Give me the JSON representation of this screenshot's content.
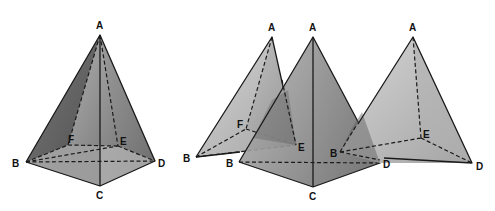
{
  "figure": {
    "colors": {
      "dark_face": "#5e5e5e",
      "mid_face": "#9a9a9a",
      "light_face": "#c6c6c6",
      "base_face": "#b8b8b8",
      "edge": "#1a1a1a",
      "background": "#ffffff"
    },
    "pyramids": [
      {
        "name": "full-pyramid",
        "vertices": {
          "A": [
            100,
            35
          ],
          "B": [
            26,
            162
          ],
          "C": [
            100,
            186
          ],
          "D": [
            155,
            161
          ],
          "E": [
            118,
            146
          ],
          "F": [
            68,
            145
          ]
        },
        "labels": [
          {
            "text": "A",
            "x": 96,
            "y": 29
          },
          {
            "text": "B",
            "x": 12,
            "y": 167
          },
          {
            "text": "C",
            "x": 96,
            "y": 199
          },
          {
            "text": "D",
            "x": 158,
            "y": 167
          },
          {
            "text": "E",
            "x": 120,
            "y": 145
          },
          {
            "text": "F",
            "x": 68,
            "y": 143
          }
        ]
      },
      {
        "name": "tetrahedron-ABFE",
        "vertices": {
          "A": [
            272,
            37
          ],
          "B": [
            196,
            157
          ],
          "F": [
            246,
            129
          ],
          "E": [
            296,
            145
          ]
        },
        "labels": [
          {
            "text": "A",
            "x": 268,
            "y": 31
          },
          {
            "text": "B",
            "x": 183,
            "y": 162
          },
          {
            "text": "F",
            "x": 237,
            "y": 128
          },
          {
            "text": "E",
            "x": 298,
            "y": 151
          }
        ]
      },
      {
        "name": "tetrahedron-ABCD",
        "vertices": {
          "A": [
            313,
            37
          ],
          "B": [
            239,
            162
          ],
          "C": [
            313,
            187
          ],
          "D": [
            380,
            163
          ]
        },
        "labels": [
          {
            "text": "A",
            "x": 309,
            "y": 31
          },
          {
            "text": "B",
            "x": 226,
            "y": 167
          },
          {
            "text": "C",
            "x": 309,
            "y": 200
          },
          {
            "text": "D",
            "x": 383,
            "y": 168
          }
        ]
      },
      {
        "name": "tetrahedron-ABED",
        "vertices": {
          "A": [
            413,
            37
          ],
          "B": [
            340,
            152
          ],
          "E": [
            421,
            138
          ],
          "D": [
            472,
            163
          ]
        },
        "labels": [
          {
            "text": "A",
            "x": 409,
            "y": 31
          },
          {
            "text": "B",
            "x": 330,
            "y": 157
          },
          {
            "text": "E",
            "x": 423,
            "y": 138
          },
          {
            "text": "D",
            "x": 476,
            "y": 170
          }
        ]
      }
    ]
  }
}
